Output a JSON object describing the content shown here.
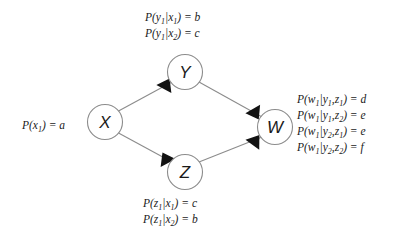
{
  "diagram": {
    "type": "bayesian-network",
    "nodes": [
      {
        "id": "X",
        "label": "X",
        "cx": 105,
        "cy": 122,
        "r": 17.5
      },
      {
        "id": "Y",
        "label": "Y",
        "cx": 185,
        "cy": 72,
        "r": 17.5
      },
      {
        "id": "Z",
        "label": "Z",
        "cx": 185,
        "cy": 172,
        "r": 17.5
      },
      {
        "id": "W",
        "label": "W",
        "cx": 275,
        "cy": 127,
        "r": 17.5
      }
    ],
    "edges": [
      {
        "from": "X",
        "to": "Y"
      },
      {
        "from": "X",
        "to": "Z"
      },
      {
        "from": "Y",
        "to": "W"
      },
      {
        "from": "Z",
        "to": "W"
      }
    ],
    "colors": {
      "background": "#ffffff",
      "node_stroke": "#8c8c8c",
      "node_fill": "#ffffff",
      "edge": "#8c8c8c",
      "arrow": "#121212",
      "text": "#1a1a1a"
    }
  },
  "cpt_top": {
    "title": "P(y1|x) distribution for Y",
    "lines": [
      {
        "head": "P(y",
        "head_sub": "1",
        "mid": "|x",
        "mid_sub": "1",
        "tail": ") = b"
      },
      {
        "head": "P(y",
        "head_sub": "1",
        "mid": "|x",
        "mid_sub": "2",
        "tail": ") = c"
      }
    ]
  },
  "cpt_left": {
    "title": "Prior for X",
    "lines": [
      {
        "head": "P(x",
        "head_sub": "1",
        "mid": "",
        "mid_sub": "",
        "tail": ") = a"
      }
    ]
  },
  "cpt_bottom": {
    "title": "P(z1|x) distribution for Z",
    "lines": [
      {
        "head": "P(z",
        "head_sub": "1",
        "mid": "|x",
        "mid_sub": "1",
        "tail": ") = c"
      },
      {
        "head": "P(z",
        "head_sub": "1",
        "mid": "|x",
        "mid_sub": "2",
        "tail": ") = b"
      }
    ]
  },
  "cpt_right": {
    "title": "P(w1|y,z) distribution for W",
    "lines": [
      {
        "head": "P(w",
        "head_sub": "1",
        "mid": "|y",
        "mid_sub": "1",
        "mid2": ",z",
        "mid2_sub": "1",
        "tail": ") = d"
      },
      {
        "head": "P(w",
        "head_sub": "1",
        "mid": "|y",
        "mid_sub": "1",
        "mid2": ",z",
        "mid2_sub": "2",
        "tail": ") = e"
      },
      {
        "head": "P(w",
        "head_sub": "1",
        "mid": "|y",
        "mid_sub": "2",
        "mid2": ",z",
        "mid2_sub": "1",
        "tail": ") = e"
      },
      {
        "head": "P(w",
        "head_sub": "1",
        "mid": "|y",
        "mid_sub": "2",
        "mid2": ",z",
        "mid2_sub": "2",
        "tail": ") = f"
      }
    ]
  }
}
